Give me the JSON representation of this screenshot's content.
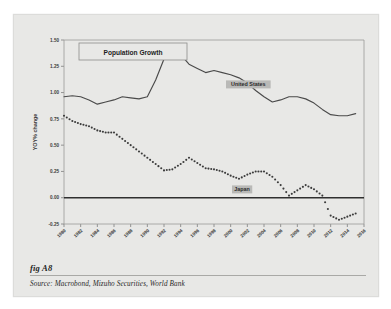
{
  "figure": {
    "fig_label": "fig A8",
    "source": "Source:  Macrobond, Mizuho Securities, World Bank",
    "panel_bg": "#e8e8e6"
  },
  "chart_data": {
    "type": "line",
    "title": "Population Growth",
    "xlabel": "",
    "ylabel": "YOY% change",
    "ylim": [
      -0.25,
      1.5
    ],
    "xlim": [
      1980,
      2016
    ],
    "yticks": [
      "1.50",
      "1.25",
      "1.00",
      "0.75",
      "0.50",
      "0.25",
      "0.00",
      "-0.25"
    ],
    "ytick_values": [
      1.5,
      1.25,
      1.0,
      0.75,
      0.5,
      0.25,
      0.0,
      -0.25
    ],
    "xticks": [
      "1980",
      "1982",
      "1984",
      "1986",
      "1988",
      "1990",
      "1992",
      "1994",
      "1996",
      "1998",
      "2000",
      "2002",
      "2004",
      "2006",
      "2008",
      "2010",
      "2012",
      "2014",
      "2016"
    ],
    "xtick_values": [
      1980,
      1982,
      1984,
      1986,
      1988,
      1990,
      1992,
      1994,
      1996,
      1998,
      2000,
      2002,
      2004,
      2006,
      2008,
      2010,
      2012,
      2014,
      2016
    ],
    "grid": false,
    "legend_position": "inline-annotation",
    "zero_line": 0.0,
    "x": [
      1980,
      1981,
      1982,
      1983,
      1984,
      1985,
      1986,
      1987,
      1988,
      1989,
      1990,
      1991,
      1992,
      1993,
      1994,
      1995,
      1996,
      1997,
      1998,
      1999,
      2000,
      2001,
      2002,
      2003,
      2004,
      2005,
      2006,
      2007,
      2008,
      2009,
      2010,
      2011,
      2012,
      2013,
      2014,
      2015
    ],
    "series": [
      {
        "name": "United States",
        "style": "solid",
        "color": "#4a4a4a",
        "values": [
          0.96,
          0.97,
          0.96,
          0.93,
          0.89,
          0.91,
          0.93,
          0.96,
          0.95,
          0.94,
          0.96,
          1.12,
          1.32,
          1.4,
          1.36,
          1.27,
          1.23,
          1.19,
          1.21,
          1.19,
          1.17,
          1.14,
          1.09,
          1.02,
          0.96,
          0.91,
          0.93,
          0.96,
          0.96,
          0.94,
          0.9,
          0.84,
          0.79,
          0.78,
          0.78,
          0.8
        ]
      },
      {
        "name": "Japan",
        "style": "dotted",
        "color": "#3b3b3b",
        "values": [
          0.78,
          0.73,
          0.7,
          0.68,
          0.64,
          0.62,
          0.62,
          0.56,
          0.5,
          0.44,
          0.38,
          0.32,
          0.26,
          0.27,
          0.32,
          0.38,
          0.33,
          0.28,
          0.27,
          0.25,
          0.21,
          0.18,
          0.22,
          0.25,
          0.25,
          0.2,
          0.12,
          0.02,
          0.07,
          0.12,
          0.08,
          0.02,
          -0.17,
          -0.21,
          -0.18,
          -0.15
        ]
      }
    ],
    "annotations": [
      {
        "text": "United States",
        "series": "United States"
      },
      {
        "text": "Japan",
        "series": "Japan"
      }
    ]
  }
}
